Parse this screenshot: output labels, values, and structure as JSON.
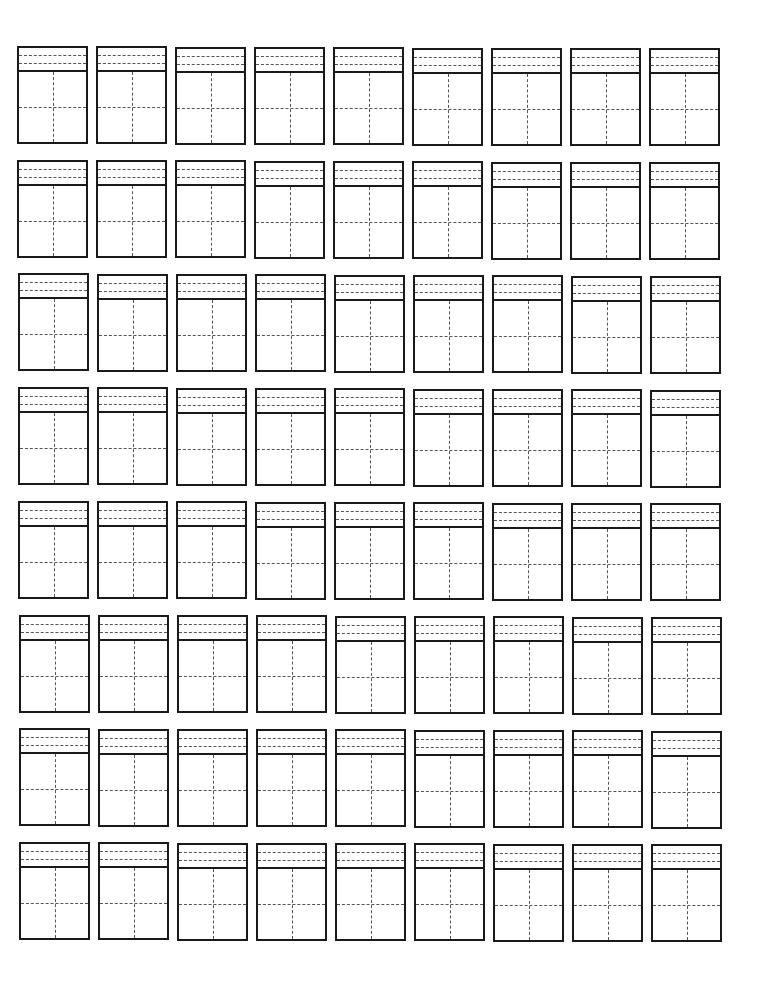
{
  "worksheet": {
    "type": "tianzige-pinyin-practice-grid",
    "rows": 8,
    "columns": 9,
    "cell": {
      "width": 71,
      "height": 98,
      "pinyin_band_height": 24,
      "pinyin_guide_lines": 2,
      "character_square_guides": [
        "horizontal-center",
        "vertical-center"
      ]
    },
    "layout": {
      "first_cell_left": 17,
      "first_cell_top": 46,
      "column_pitch": 79,
      "row_pitch": 113.7,
      "row_skew_x": 0.3,
      "col_skew_y": 0.3
    },
    "colors": {
      "background": "#ffffff",
      "border": "#1a1a1a",
      "guide": "#555555"
    }
  }
}
